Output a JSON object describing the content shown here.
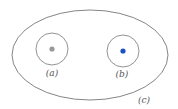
{
  "diagram": {
    "outer": {
      "label": "(c)",
      "stroke": "#666666"
    },
    "circles": [
      {
        "label": "(a)",
        "dot_color": "#999999",
        "stroke": "#777777"
      },
      {
        "label": "(b)",
        "dot_color": "#1f4fc4",
        "stroke": "#777777"
      }
    ]
  }
}
